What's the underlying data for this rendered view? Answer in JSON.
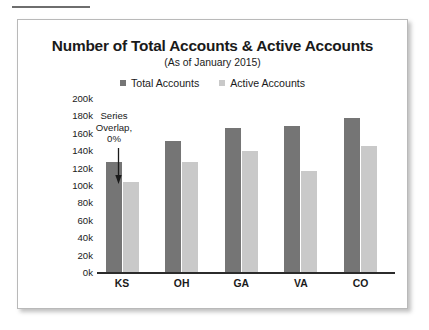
{
  "card": {
    "top_rule": "divider-rule"
  },
  "chart_data": {
    "type": "bar",
    "title": "Number of Total Accounts & Active Accounts",
    "subtitle": "(As of January 2015)",
    "xlabel": "",
    "ylabel": "",
    "grid": false,
    "legend_position": "top",
    "categories": [
      "KS",
      "OH",
      "GA",
      "VA",
      "CO"
    ],
    "series": [
      {
        "name": "Total Accounts",
        "color": "#757575",
        "values": [
          127000,
          151000,
          165000,
          168000,
          177000
        ]
      },
      {
        "name": "Active Accounts",
        "color": "#c9c9c9",
        "values": [
          104000,
          127000,
          139000,
          116000,
          145000
        ]
      }
    ],
    "ylim": [
      0,
      200000
    ],
    "ytick_values": [
      200000,
      180000,
      160000,
      140000,
      120000,
      100000,
      80000,
      60000,
      40000,
      20000,
      0
    ],
    "ytick_labels": [
      "200k",
      "180k",
      "160k",
      "140k",
      "120k",
      "100k",
      "80k",
      "60k",
      "40k",
      "20k",
      "0k"
    ],
    "annotations": [
      {
        "text": "Series Overlap, 0%",
        "lines": [
          "Series",
          "Overlap,",
          "0%"
        ],
        "marker": "down-arrow"
      }
    ]
  }
}
